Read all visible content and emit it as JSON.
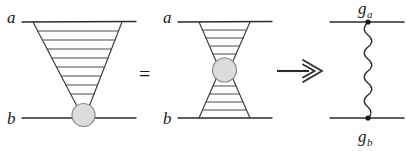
{
  "figure": {
    "background_color": "#ffffff",
    "line_color": "#2b2b2b",
    "blob_fill_color": "#dcdcdc",
    "blob_stroke_color": "#8a8a8a",
    "width": 407,
    "height": 151
  },
  "diagram_left": {
    "name": "ladder-diagram",
    "top_label": "a",
    "bottom_label": "b",
    "rung_count": 8,
    "shape": "inverted-triangle",
    "blob_label": "",
    "top_rail_y": 22,
    "bottom_rail_y": 118
  },
  "operator_equals": {
    "symbol": "=",
    "name": "equals-sign"
  },
  "diagram_middle": {
    "name": "hourglass-diagram",
    "top_label": "a",
    "bottom_label": "b",
    "upper_rung_count": 4,
    "lower_rung_count": 4,
    "shape": "hourglass",
    "top_rail_y": 22,
    "bottom_rail_y": 118
  },
  "operator_implies": {
    "symbol": "⟹",
    "name": "double-arrow-right"
  },
  "diagram_right": {
    "name": "exchange-diagram",
    "top_label_base": "g",
    "top_label_sub": "a",
    "bottom_label_base": "g",
    "bottom_label_sub": "b",
    "exchange_line_style": "wavy",
    "top_rail_y": 22,
    "bottom_rail_y": 118,
    "vertex_count": 2
  }
}
